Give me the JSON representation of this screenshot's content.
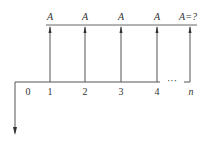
{
  "diagram": {
    "type": "cash-flow",
    "periods": [
      {
        "label": "0",
        "x": 28
      },
      {
        "label": "1",
        "x": 50
      },
      {
        "label": "2",
        "x": 85
      },
      {
        "label": "3",
        "x": 121
      },
      {
        "label": "4",
        "x": 157
      },
      {
        "label": "n",
        "x": 190
      }
    ],
    "ellipsis": "···",
    "inflows": [
      {
        "label": "A",
        "x": 50
      },
      {
        "label": "A",
        "x": 85
      },
      {
        "label": "A",
        "x": 121
      },
      {
        "label": "A",
        "x": 157
      },
      {
        "label": "A=?",
        "x": 190
      }
    ],
    "line_color": "#555555"
  }
}
